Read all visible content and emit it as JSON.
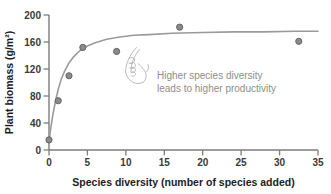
{
  "chart_data": {
    "type": "scatter",
    "title": "",
    "xlabel": "Species diversity (number of species added)",
    "ylabel": "Plant biomass (g/m²)",
    "xlim": [
      0,
      35
    ],
    "ylim": [
      0,
      200
    ],
    "xticks": [
      "0",
      "5",
      "10",
      "15",
      "20",
      "25",
      "30",
      "35"
    ],
    "xtick_values": [
      0,
      5,
      10,
      15,
      20,
      25,
      30,
      35
    ],
    "yticks": [
      "0",
      "40",
      "80",
      "120",
      "160",
      "200"
    ],
    "ytick_values": [
      0,
      40,
      80,
      120,
      160,
      200
    ],
    "grid": false,
    "legend": false,
    "series": [
      {
        "name": "Plant biomass",
        "marker": "circle",
        "marker_color": "#8a8a8a",
        "x": [
          0,
          1.2,
          2.6,
          4.4,
          8.8,
          17.0,
          32.5
        ],
        "y": [
          15,
          73,
          110,
          152,
          146,
          182,
          161
        ]
      }
    ],
    "fit_curve": {
      "name": "saturating fit",
      "color": "#9a9a9a",
      "asymptote": 175,
      "x": [
        0,
        0.2,
        0.5,
        0.8,
        1.2,
        1.6,
        2.0,
        2.6,
        3.2,
        4.0,
        5.0,
        6.0,
        7.5,
        9.0,
        11.0,
        13.0,
        16.0,
        20.0,
        24.0,
        28.0,
        32.0,
        35.0
      ],
      "y": [
        10,
        30,
        52,
        70,
        90,
        105,
        116,
        129,
        138,
        147,
        154,
        159,
        164,
        167,
        170,
        171,
        173,
        174,
        175,
        175,
        176,
        176
      ]
    },
    "annotations": [
      {
        "name": "insight-note",
        "line1": "Higher species diversity",
        "line2": "leads to higher productivity",
        "color": "#8d8d8d"
      },
      {
        "name": "pointing-hand-sketch",
        "kind": "hand-drawn pointing hand"
      }
    ],
    "colors": {
      "axis": "#7d7d7d",
      "marker": "#8a8a8a",
      "marker_edge": "#5f5f5f",
      "curve": "#9a9a9a",
      "text": "#1d1d1d",
      "annotation": "#8d8d8d",
      "background": "#ffffff"
    }
  }
}
